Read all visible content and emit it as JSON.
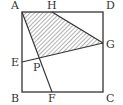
{
  "diagram": {
    "type": "geometry",
    "shape": "square ABCD with shaded quadrilateral AHGP",
    "points": {
      "A": {
        "label": "A",
        "x": 22,
        "y": 12
      },
      "D": {
        "label": "D",
        "x": 103,
        "y": 12
      },
      "C": {
        "label": "C",
        "x": 103,
        "y": 92
      },
      "B": {
        "label": "B",
        "x": 22,
        "y": 92
      },
      "H": {
        "label": "H",
        "x": 52,
        "y": 12
      },
      "G": {
        "label": "G",
        "x": 103,
        "y": 43
      },
      "E": {
        "label": "E",
        "x": 22,
        "y": 62
      },
      "F": {
        "label": "F",
        "x": 52,
        "y": 92
      },
      "P": {
        "label": "P",
        "x": 39,
        "y": 58
      }
    },
    "segments": [
      "AD",
      "DC",
      "CB",
      "BA",
      "AF",
      "EG",
      "HG"
    ],
    "shaded_region": [
      "A",
      "H",
      "G",
      "P"
    ],
    "colors": {
      "stroke": "#333333",
      "hatch": "#555555",
      "background": "#ffffff"
    }
  }
}
